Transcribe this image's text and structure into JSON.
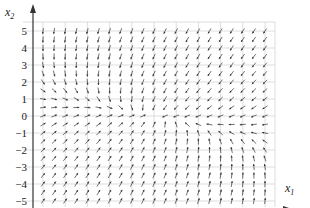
{
  "chart_data": {
    "type": "vector_field",
    "title": "",
    "xlabel": "x1",
    "ylabel": "x2",
    "xlim": [
      -5,
      5
    ],
    "ylim": [
      -5,
      5
    ],
    "xticks": [
      -5,
      -4,
      -3,
      -2,
      -1,
      0,
      1,
      2,
      3,
      4,
      5
    ],
    "yticks": [
      -5,
      -4,
      -3,
      -2,
      -1,
      0,
      1,
      2,
      3,
      4,
      5
    ],
    "grid": true,
    "arrow_spacing": 0.5,
    "field_description": "Direction field of a linear system converging toward the origin; arrows point down at top, up at bottom, right on the left side near x2=0, left on the right side near x2=0",
    "field": {
      "a11": -0.35,
      "a12": -0.45,
      "a21": -0.15,
      "a22": -1.0
    }
  },
  "axes": {
    "x_label_main": "x",
    "x_label_sub": "1",
    "y_label_main": "x",
    "y_label_sub": "2",
    "x_tick_labels": [
      "−5",
      "−4",
      "−3",
      "−2",
      "−1",
      "0",
      "1",
      "2",
      "3",
      "4",
      "5"
    ],
    "y_tick_labels": [
      "5",
      "4",
      "3",
      "2",
      "1",
      "0",
      "−1",
      "−2",
      "−3",
      "−4",
      "−5"
    ]
  },
  "colors": {
    "grid": "#c8c8c8",
    "axis": "#333333",
    "arrow": "#333333"
  }
}
